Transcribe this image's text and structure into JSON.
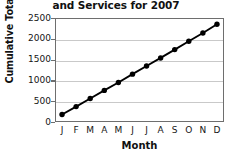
{
  "chart_data": {
    "type": "line",
    "title": "and Services for 2007",
    "xlabel": "Month",
    "ylabel": "Cumulative Total ($ billions)",
    "categories": [
      "J",
      "F",
      "M",
      "A",
      "M",
      "J",
      "J",
      "A",
      "S",
      "O",
      "N",
      "D"
    ],
    "category_names": [
      "January",
      "February",
      "March",
      "April",
      "May",
      "June",
      "July",
      "August",
      "September",
      "October",
      "November",
      "December"
    ],
    "values": [
      180,
      370,
      565,
      760,
      950,
      1150,
      1345,
      1540,
      1740,
      1940,
      2140,
      2350
    ],
    "series": [
      {
        "name": "Cumulative Total",
        "values": [
          180,
          370,
          565,
          760,
          950,
          1150,
          1345,
          1540,
          1740,
          1940,
          2140,
          2350
        ]
      }
    ],
    "ylim": [
      0,
      2500
    ],
    "yticks": [
      0,
      500,
      1000,
      1500,
      2000,
      2500
    ],
    "ytick_labels": [
      "0",
      "500",
      "1000",
      "1500",
      "2000",
      "2500"
    ],
    "grid": true,
    "legend": false,
    "marker": "filled-circle",
    "line_color": "#000000",
    "marker_color": "#000000",
    "grid_color": "#c9c9c9",
    "frame_color": "#6e6e6e"
  }
}
